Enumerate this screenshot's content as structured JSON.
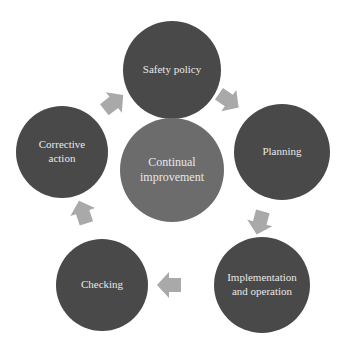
{
  "diagram": {
    "type": "cycle",
    "colors": {
      "outer_node": "#494949",
      "center_node": "#6c6c6c",
      "arrow": "#a9a9a9",
      "text": "#e8e8e8",
      "background": "#ffffff"
    },
    "center": {
      "label_line1": "Continual",
      "label_line2": "improvement"
    },
    "nodes": [
      {
        "label_line1": "Safety policy",
        "label_line2": ""
      },
      {
        "label_line1": "Planning",
        "label_line2": ""
      },
      {
        "label_line1": "Implementation",
        "label_line2": "and operation"
      },
      {
        "label_line1": "Checking",
        "label_line2": ""
      },
      {
        "label_line1": "Corrective",
        "label_line2": "action"
      }
    ],
    "arrows": [
      {
        "from": "Safety policy",
        "to": "Planning"
      },
      {
        "from": "Planning",
        "to": "Implementation and operation"
      },
      {
        "from": "Implementation and operation",
        "to": "Checking"
      },
      {
        "from": "Checking",
        "to": "Corrective action"
      },
      {
        "from": "Corrective action",
        "to": "Safety policy"
      }
    ]
  }
}
